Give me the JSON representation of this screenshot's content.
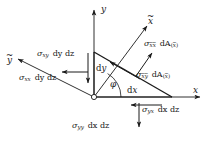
{
  "figure": {
    "type": "stress-element-diagram",
    "background_color": "#ffffff",
    "stroke_color": "#1a1a1a",
    "text_color": "#1a1a1a"
  },
  "axes": {
    "y": "y",
    "x": "x",
    "x_tilde_base": "x",
    "y_tilde_base": "y",
    "tilde": "~"
  },
  "angle": {
    "symbol": "φ"
  },
  "edges": {
    "dy": "dy",
    "dx": "dx",
    "d": "d",
    "y": "y",
    "x": "x"
  },
  "labels": {
    "sigma": "σ",
    "sigma_xy": {
      "sym": "σ",
      "sub": "xy",
      "term": "dy dz",
      "full": "σxy dy dz"
    },
    "sigma_xx": {
      "sym": "σ",
      "sub": "xx",
      "term": "dy dz",
      "full": "σxx dy dz"
    },
    "sigma_yy": {
      "sym": "σ",
      "sub": "yy",
      "term": "dx dz",
      "full": "σyy dx dz"
    },
    "sigma_yx": {
      "sym": "σ",
      "sub": "yx",
      "term": "dx dz",
      "full": "σyx dx dz"
    },
    "sigma_xtxt": {
      "sym": "σ",
      "sub_a": "x",
      "sub_b": "x",
      "term": "dA",
      "paren_sub": "x",
      "full": "σx̃x̃ dA(x̃)"
    },
    "sigma_xtyt": {
      "sym": "σ",
      "sub_a": "x",
      "sub_b": "y",
      "term": "dA",
      "paren_sub": "x",
      "full": "σx̃ỹ dA(x̃)"
    }
  },
  "geometry": {
    "origin": {
      "x": 94,
      "y": 97
    },
    "triangle_top": {
      "x": 94,
      "y": 52
    },
    "triangle_right": {
      "x": 172,
      "y": 97
    },
    "y_axis_tip": {
      "x": 94,
      "y": 8
    },
    "x_axis_tip": {
      "x": 202,
      "y": 97
    },
    "x_tilde_tip": {
      "x": 148,
      "y": 24
    },
    "y_tilde_tip": {
      "x": 16,
      "y": 58
    }
  }
}
